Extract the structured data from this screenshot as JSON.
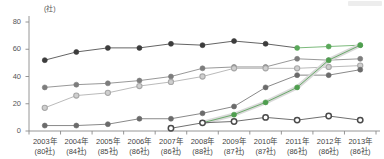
{
  "axis": {
    "unit_label": "(社)",
    "y_ticks": [
      0,
      20,
      40,
      60,
      80
    ],
    "y_min": 0,
    "y_max": 80
  },
  "chart_data": {
    "type": "line",
    "title": "",
    "xlabel": "",
    "ylabel": "(社)",
    "ylim": [
      0,
      80
    ],
    "grid": false,
    "legend": "none",
    "categories": [
      "2003年",
      "2004年",
      "2005年",
      "2006年",
      "2007年",
      "2008年",
      "2009年",
      "2010年",
      "2011年",
      "2012年",
      "2013年"
    ],
    "category_sublabels": [
      "(80社)",
      "(84社)",
      "(85社)",
      "(86社)",
      "(86社)",
      "(88社)",
      "(87社)",
      "(87社)",
      "(86社)",
      "(86社)",
      "(86社)"
    ],
    "series": [
      {
        "name": "series-1-top",
        "color": "#3c3c3c",
        "accent_color": "#5aa85a",
        "marker": "filled",
        "x": [
          "2003年",
          "2004年",
          "2005年",
          "2006年",
          "2007年",
          "2008年",
          "2009年",
          "2010年",
          "2011年",
          "2012年",
          "2013年"
        ],
        "values": [
          52,
          58,
          61,
          61,
          64,
          63,
          66,
          64,
          61,
          62,
          63
        ],
        "accent_from_index": 8
      },
      {
        "name": "series-2-upper-mid",
        "color": "#7d7d7d",
        "marker": "filled",
        "x": [
          "2003年",
          "2004年",
          "2005年",
          "2006年",
          "2007年",
          "2008年",
          "2009年",
          "2010年",
          "2011年",
          "2012年",
          "2013年"
        ],
        "values": [
          32,
          34,
          35,
          37,
          40,
          46,
          47,
          47,
          53,
          52,
          53
        ]
      },
      {
        "name": "series-3-lower-mid",
        "color": "#a8a8a8",
        "marker": "open",
        "x": [
          "2003年",
          "2004年",
          "2005年",
          "2006年",
          "2007年",
          "2008年",
          "2009年",
          "2010年",
          "2011年",
          "2012年",
          "2013年"
        ],
        "values": [
          17,
          26,
          28,
          33,
          36,
          40,
          46,
          46,
          46,
          47,
          48
        ]
      },
      {
        "name": "series-4-rising",
        "color": "#6b6b6b",
        "marker": "filled",
        "x": [
          "2003年",
          "2004年",
          "2005年",
          "2006年",
          "2007年",
          "2008年",
          "2009年",
          "2010年",
          "2011年",
          "2012年",
          "2013年"
        ],
        "values": [
          4,
          4,
          5,
          9,
          9,
          13,
          18,
          32,
          41,
          41,
          45
        ]
      },
      {
        "name": "series-5-highlight",
        "color": "#4f9e4f",
        "band_color": "#d7d7d7",
        "marker": "filled",
        "x": [
          "2008年",
          "2009年",
          "2010年",
          "2011年",
          "2012年",
          "2013年"
        ],
        "values": [
          6,
          12,
          21,
          32,
          52,
          63
        ]
      },
      {
        "name": "series-6-bottom",
        "color": "#4a4a4a",
        "marker": "hollow",
        "x": [
          "2007年",
          "2008年",
          "2009年",
          "2010年",
          "2011年",
          "2012年",
          "2013年"
        ],
        "values": [
          2,
          6,
          7,
          10,
          8,
          11,
          8
        ]
      }
    ]
  }
}
